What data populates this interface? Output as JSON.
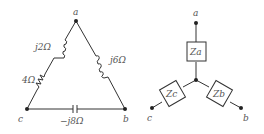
{
  "delta": {
    "nodes": {
      "a": "a",
      "b": "b",
      "c": "c"
    },
    "labels": {
      "inductor_ca": "j2Ω",
      "resistor_ca": "4Ω",
      "inductor_ab": "j6Ω",
      "capacitor_bc": "−j8Ω"
    }
  },
  "wye": {
    "nodes": {
      "a": "a",
      "b": "b",
      "c": "c"
    },
    "labels": {
      "za": "Za",
      "zb": "Zb",
      "zc": "Zc"
    }
  }
}
